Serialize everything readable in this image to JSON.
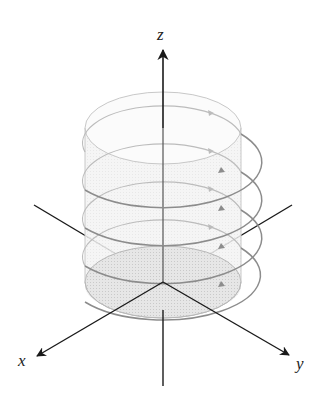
{
  "figure": {
    "axes": {
      "x_label": "x",
      "y_label": "y",
      "z_label": "z"
    },
    "cylinder": {
      "center_x": 163,
      "radius_x": 78,
      "radius_y": 36,
      "top_center_y": 128,
      "bottom_center_y": 282
    },
    "helix": {
      "turns": 4,
      "direction": "counterclockwise arrows pointing right on visible side"
    },
    "colors": {
      "axis": "#1a1a1a",
      "cylinder_outline": "#c8c8c8",
      "cylinder_fill": "#efefef",
      "base_disk_fill": "#d4d4d4",
      "helix_front": "#8c8c8c",
      "helix_back": "#bcbcbc",
      "background": "#ffffff"
    }
  }
}
